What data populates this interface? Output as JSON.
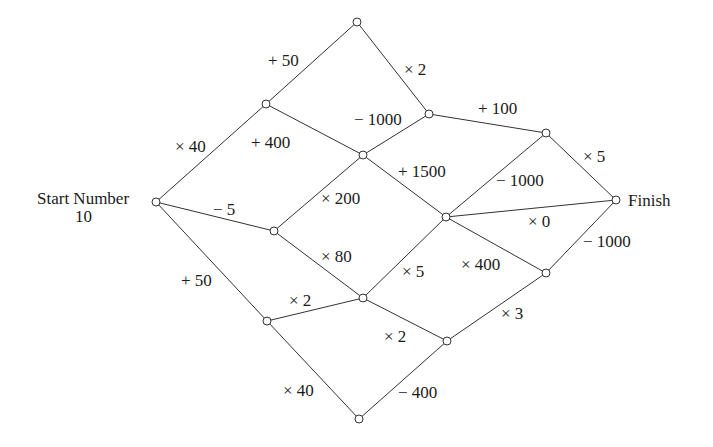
{
  "diagram": {
    "type": "path-network",
    "start": {
      "label": "Start Number",
      "value": "10"
    },
    "finish": {
      "label": "Finish"
    },
    "nodes": [
      {
        "id": "S",
        "x": 156,
        "y": 202
      },
      {
        "id": "A",
        "x": 266,
        "y": 104
      },
      {
        "id": "T",
        "x": 357,
        "y": 22
      },
      {
        "id": "B",
        "x": 429,
        "y": 114
      },
      {
        "id": "C",
        "x": 363,
        "y": 155
      },
      {
        "id": "D",
        "x": 274,
        "y": 231
      },
      {
        "id": "E",
        "x": 546,
        "y": 133
      },
      {
        "id": "F",
        "x": 446,
        "y": 217
      },
      {
        "id": "FIN",
        "x": 616,
        "y": 200
      },
      {
        "id": "G",
        "x": 363,
        "y": 298
      },
      {
        "id": "H",
        "x": 546,
        "y": 273
      },
      {
        "id": "I",
        "x": 267,
        "y": 321
      },
      {
        "id": "J",
        "x": 447,
        "y": 341
      },
      {
        "id": "K",
        "x": 359,
        "y": 419
      }
    ],
    "edges": [
      {
        "from": "S",
        "to": "A",
        "label": "× 40",
        "lx": 175,
        "ly": 152
      },
      {
        "from": "A",
        "to": "T",
        "label": "+ 50",
        "lx": 268,
        "ly": 66
      },
      {
        "from": "T",
        "to": "B",
        "label": "× 2",
        "lx": 404,
        "ly": 75
      },
      {
        "from": "A",
        "to": "C",
        "label": "+ 400",
        "lx": 251,
        "ly": 148
      },
      {
        "from": "C",
        "to": "B",
        "label": "− 1000",
        "lx": 354,
        "ly": 125
      },
      {
        "from": "B",
        "to": "E",
        "label": "+ 100",
        "lx": 478,
        "ly": 114
      },
      {
        "from": "E",
        "to": "FIN",
        "label": "× 5",
        "lx": 583,
        "ly": 162
      },
      {
        "from": "C",
        "to": "F",
        "label": "+ 1500",
        "lx": 398,
        "ly": 177
      },
      {
        "from": "F",
        "to": "E",
        "label": "− 1000",
        "lx": 496,
        "ly": 186
      },
      {
        "from": "S",
        "to": "D",
        "label": "− 5",
        "lx": 213,
        "ly": 215
      },
      {
        "from": "D",
        "to": "C",
        "label": "× 200",
        "lx": 321,
        "ly": 204
      },
      {
        "from": "F",
        "to": "FIN",
        "label": "× 0",
        "lx": 528,
        "ly": 227
      },
      {
        "from": "D",
        "to": "G",
        "label": "× 80",
        "lx": 321,
        "ly": 262
      },
      {
        "from": "G",
        "to": "F",
        "label": "× 5",
        "lx": 402,
        "ly": 277
      },
      {
        "from": "F",
        "to": "H",
        "label": "× 400",
        "lx": 461,
        "ly": 270
      },
      {
        "from": "H",
        "to": "FIN",
        "label": "− 1000",
        "lx": 583,
        "ly": 247
      },
      {
        "from": "S",
        "to": "I",
        "label": "+ 50",
        "lx": 181,
        "ly": 286
      },
      {
        "from": "I",
        "to": "G",
        "label": "× 2",
        "lx": 289,
        "ly": 306
      },
      {
        "from": "G",
        "to": "J",
        "label": "× 2",
        "lx": 384,
        "ly": 342
      },
      {
        "from": "J",
        "to": "H",
        "label": "× 3",
        "lx": 501,
        "ly": 319
      },
      {
        "from": "I",
        "to": "K",
        "label": "× 40",
        "lx": 283,
        "ly": 396
      },
      {
        "from": "K",
        "to": "J",
        "label": "− 400",
        "lx": 398,
        "ly": 398
      }
    ]
  }
}
